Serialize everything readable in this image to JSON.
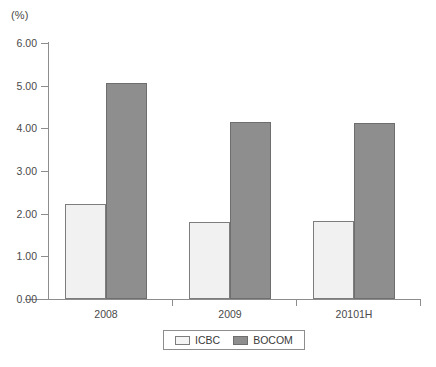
{
  "chart_data": {
    "type": "bar",
    "title": "",
    "subtitle": "",
    "unit_label": "(%)",
    "xlabel": "",
    "ylabel": "",
    "categories": [
      "2008",
      "2009",
      "20101H"
    ],
    "series": [
      {
        "name": "ICBC",
        "values": [
          2.23,
          1.8,
          1.84
        ],
        "color": "#f1f1f1"
      },
      {
        "name": "BOCOM",
        "values": [
          5.06,
          4.15,
          4.13
        ],
        "color": "#8e8e8e"
      }
    ],
    "ylim": [
      0.0,
      6.0
    ],
    "ytick_values": [
      0.0,
      1.0,
      2.0,
      3.0,
      4.0,
      5.0,
      6.0
    ],
    "ytick_labels": [
      "0.00",
      "1.00",
      "2.00",
      "3.00",
      "4.00",
      "5.00",
      "6.00"
    ],
    "grid": false,
    "legend_position": "bottom-center",
    "legend_entries": [
      "ICBC",
      "BOCOM"
    ],
    "annotations": []
  }
}
